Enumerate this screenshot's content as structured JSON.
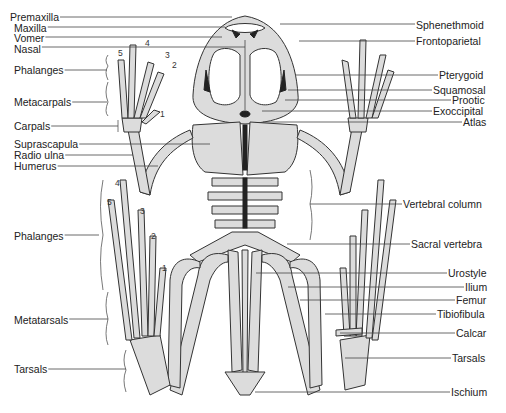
{
  "diagram": {
    "labels_left": [
      {
        "id": "premaxilla",
        "text": "Premaxilla",
        "x": 10,
        "y": 11,
        "lx2": 232,
        "ly": 17
      },
      {
        "id": "maxilla",
        "text": "Maxilla",
        "x": 14,
        "y": 22,
        "lx2": 225,
        "ly": 27
      },
      {
        "id": "vomer",
        "text": "Vomer",
        "x": 14,
        "y": 32,
        "lx2": 222,
        "ly": 37
      },
      {
        "id": "nasal",
        "text": "Nasal",
        "x": 14,
        "y": 43,
        "lx2": 245,
        "ly": 47
      },
      {
        "id": "phalanges-fore",
        "text": "Phalanges",
        "x": 14,
        "y": 64,
        "lx2": 107,
        "ly": 70
      },
      {
        "id": "metacarpals",
        "text": "Metacarpals",
        "x": 14,
        "y": 96,
        "lx2": 107,
        "ly": 102
      },
      {
        "id": "carpals",
        "text": "Carpals",
        "x": 14,
        "y": 120,
        "lx2": 118,
        "ly": 126
      },
      {
        "id": "suprascapula",
        "text": "Suprascapula",
        "x": 14,
        "y": 138,
        "lx2": 210,
        "ly": 144
      },
      {
        "id": "radio-ulna",
        "text": "Radio ulna",
        "x": 14,
        "y": 149,
        "lx2": 133,
        "ly": 155
      },
      {
        "id": "humerus",
        "text": "Humerus",
        "x": 14,
        "y": 160,
        "lx2": 158,
        "ly": 166
      },
      {
        "id": "phalanges-hind",
        "text": "Phalanges",
        "x": 14,
        "y": 230,
        "lx2": 99,
        "ly": 235
      },
      {
        "id": "metatarsals",
        "text": "Metatarsals",
        "x": 14,
        "y": 314,
        "lx2": 108,
        "ly": 319
      },
      {
        "id": "tarsals-left",
        "text": "Tarsals",
        "x": 14,
        "y": 363,
        "lx2": 126,
        "ly": 369
      }
    ],
    "labels_right": [
      {
        "id": "sphenethmoid",
        "text": "Sphenethmoid",
        "x": 416,
        "y": 19,
        "lx1": 280,
        "ly": 24
      },
      {
        "id": "frontoparietal",
        "text": "Frontoparietal",
        "x": 416,
        "y": 35,
        "lx1": 299,
        "ly": 41
      },
      {
        "id": "pterygoid",
        "text": "Pterygoid",
        "x": 439,
        "y": 69,
        "lx1": 295,
        "ly": 75
      },
      {
        "id": "squamosal",
        "text": "Squamosal",
        "x": 433,
        "y": 84,
        "lx1": 288,
        "ly": 90
      },
      {
        "id": "prootic",
        "text": "Prootic",
        "x": 452,
        "y": 94,
        "lx1": 285,
        "ly": 100
      },
      {
        "id": "exoccipital",
        "text": "Exoccipital",
        "x": 433,
        "y": 105,
        "lx1": 262,
        "ly": 111
      },
      {
        "id": "atlas",
        "text": "Atlas",
        "x": 463,
        "y": 116,
        "lx1": 263,
        "ly": 122
      },
      {
        "id": "vertebral-column",
        "text": "Vertebral column",
        "x": 403,
        "y": 198,
        "lx1": 310,
        "ly": 204
      },
      {
        "id": "sacral-vertebra",
        "text": "Sacral vertebra",
        "x": 411,
        "y": 238,
        "lx1": 287,
        "ly": 244
      },
      {
        "id": "urostyle",
        "text": "Urostyle",
        "x": 448,
        "y": 267,
        "lx1": 256,
        "ly": 273
      },
      {
        "id": "ilium",
        "text": "Ilium",
        "x": 465,
        "y": 281,
        "lx1": 288,
        "ly": 287
      },
      {
        "id": "femur",
        "text": "Femur",
        "x": 456,
        "y": 294,
        "lx1": 300,
        "ly": 300
      },
      {
        "id": "tibiofibula",
        "text": "Tibiofibula",
        "x": 437,
        "y": 308,
        "lx1": 325,
        "ly": 314
      },
      {
        "id": "calcar",
        "text": "Calcar",
        "x": 456,
        "y": 327,
        "lx1": 340,
        "ly": 333
      },
      {
        "id": "tarsals-right",
        "text": "Tarsals",
        "x": 452,
        "y": 352,
        "lx1": 345,
        "ly": 358
      },
      {
        "id": "ischium",
        "text": "Ischium",
        "x": 451,
        "y": 386,
        "lx1": 255,
        "ly": 392
      }
    ],
    "digit_numbers_fore": [
      {
        "text": "5",
        "x": 118,
        "y": 49
      },
      {
        "text": "4",
        "x": 145,
        "y": 39
      },
      {
        "text": "3",
        "x": 165,
        "y": 51
      },
      {
        "text": "2",
        "x": 172,
        "y": 61
      },
      {
        "text": "1",
        "x": 160,
        "y": 110
      }
    ],
    "digit_numbers_hind": [
      {
        "text": "4",
        "x": 115,
        "y": 179
      },
      {
        "text": "5",
        "x": 107,
        "y": 198
      },
      {
        "text": "3",
        "x": 140,
        "y": 207
      },
      {
        "text": "2",
        "x": 151,
        "y": 232
      },
      {
        "text": "1",
        "x": 162,
        "y": 264
      }
    ],
    "colors": {
      "bone_fill": "#dcdcdc",
      "outline": "#333333",
      "dark_fill": "#222222",
      "text": "#222222",
      "background": "#ffffff"
    }
  }
}
